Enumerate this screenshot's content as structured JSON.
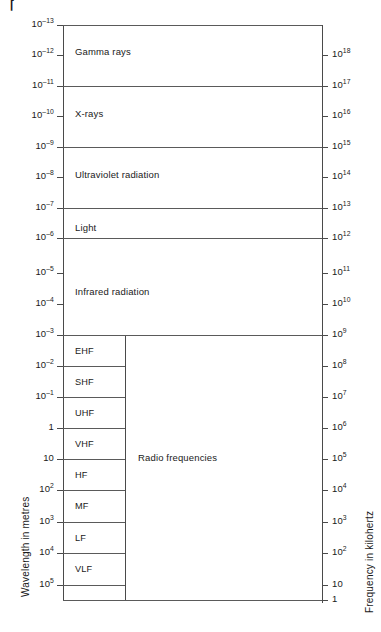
{
  "figure": {
    "type": "diagram"
  },
  "left_axis": {
    "title": "Wavelength in metres",
    "unit": "metres",
    "ticks": [
      {
        "label": "10",
        "exp": "–13",
        "value": -13,
        "y": 25
      },
      {
        "label": "10",
        "exp": "–12",
        "value": -12,
        "y": 55
      },
      {
        "label": "10",
        "exp": "–11",
        "value": -11,
        "y": 86
      },
      {
        "label": "10",
        "exp": "–10",
        "value": -10,
        "y": 116
      },
      {
        "label": "10",
        "exp": "–9",
        "value": -9,
        "y": 147
      },
      {
        "label": "10",
        "exp": "–8",
        "value": -8,
        "y": 177
      },
      {
        "label": "10",
        "exp": "–7",
        "value": -7,
        "y": 208
      },
      {
        "label": "10",
        "exp": "–6",
        "value": -6,
        "y": 238
      },
      {
        "label": "10",
        "exp": "–5",
        "value": -5,
        "y": 273
      },
      {
        "label": "10",
        "exp": "–4",
        "value": -4,
        "y": 304
      },
      {
        "label": "10",
        "exp": "–3",
        "value": -3,
        "y": 335
      },
      {
        "label": "10",
        "exp": "–2",
        "value": -2,
        "y": 366
      },
      {
        "label": "10",
        "exp": "–1",
        "value": -1,
        "y": 397
      },
      {
        "label": "1",
        "exp": "",
        "value": 0,
        "y": 428
      },
      {
        "label": "10",
        "exp": "",
        "value": 1,
        "y": 459
      },
      {
        "label": "10",
        "exp": "2",
        "value": 2,
        "y": 490
      },
      {
        "label": "10",
        "exp": "3",
        "value": 3,
        "y": 522
      },
      {
        "label": "10",
        "exp": "4",
        "value": 4,
        "y": 553
      },
      {
        "label": "10",
        "exp": "5",
        "value": 5,
        "y": 585
      }
    ]
  },
  "right_axis": {
    "title": "Frequency in kilohertz",
    "unit": "kilohertz",
    "ticks": [
      {
        "label": "10",
        "exp": "18",
        "value": 18,
        "y": 55
      },
      {
        "label": "10",
        "exp": "17",
        "value": 17,
        "y": 86
      },
      {
        "label": "10",
        "exp": "16",
        "value": 16,
        "y": 116
      },
      {
        "label": "10",
        "exp": "15",
        "value": 15,
        "y": 147
      },
      {
        "label": "10",
        "exp": "14",
        "value": 14,
        "y": 177
      },
      {
        "label": "10",
        "exp": "13",
        "value": 13,
        "y": 208
      },
      {
        "label": "10",
        "exp": "12",
        "value": 12,
        "y": 238
      },
      {
        "label": "10",
        "exp": "11",
        "value": 11,
        "y": 273
      },
      {
        "label": "10",
        "exp": "10",
        "value": 10,
        "y": 304
      },
      {
        "label": "10",
        "exp": "9",
        "value": 9,
        "y": 335
      },
      {
        "label": "10",
        "exp": "8",
        "value": 8,
        "y": 366
      },
      {
        "label": "10",
        "exp": "7",
        "value": 7,
        "y": 397
      },
      {
        "label": "10",
        "exp": "6",
        "value": 6,
        "y": 428
      },
      {
        "label": "10",
        "exp": "5",
        "value": 5,
        "y": 459
      },
      {
        "label": "10",
        "exp": "4",
        "value": 4,
        "y": 490
      },
      {
        "label": "10",
        "exp": "3",
        "value": 3,
        "y": 522
      },
      {
        "label": "10",
        "exp": "2",
        "value": 2,
        "y": 553
      },
      {
        "label": "10",
        "exp": "",
        "value": 1,
        "y": 585
      },
      {
        "label": "1",
        "exp": "",
        "value": 0,
        "y": 600
      }
    ]
  },
  "bands": [
    {
      "name": "Gamma rays",
      "top": 25,
      "bottom": 86,
      "label_y": 52
    },
    {
      "name": "X-rays",
      "top": 86,
      "bottom": 147,
      "label_y": 114
    },
    {
      "name": "Ultraviolet radiation",
      "top": 147,
      "bottom": 208,
      "label_y": 175
    },
    {
      "name": "Light",
      "top": 208,
      "bottom": 238,
      "label_y": 228
    },
    {
      "name": "Infrared radiation",
      "top": 238,
      "bottom": 335,
      "label_y": 292
    },
    {
      "name": "Radio frequencies",
      "top": 335,
      "bottom": 600,
      "label_y": 458
    }
  ],
  "radio_subbands": [
    {
      "name": "EHF",
      "top": 335,
      "bottom": 366,
      "label_y": 352
    },
    {
      "name": "SHF",
      "top": 366,
      "bottom": 397,
      "label_y": 383
    },
    {
      "name": "UHF",
      "top": 397,
      "bottom": 428,
      "label_y": 414
    },
    {
      "name": "VHF",
      "top": 428,
      "bottom": 459,
      "label_y": 445
    },
    {
      "name": "HF",
      "top": 459,
      "bottom": 490,
      "label_y": 476
    },
    {
      "name": "MF",
      "top": 490,
      "bottom": 522,
      "label_y": 507
    },
    {
      "name": "LF",
      "top": 522,
      "bottom": 553,
      "label_y": 539
    },
    {
      "name": "VLF",
      "top": 553,
      "bottom": 585,
      "label_y": 570
    }
  ],
  "colors": {
    "line": "#5a5a5a",
    "axis": "#4a4a4a",
    "text": "#1a1a1a",
    "background": "#ffffff"
  },
  "chart_data": {
    "type": "diagram",
    "xlabel": "",
    "ylabel": "Wavelength in metres",
    "y2label": "Frequency in kilohertz",
    "grid": false,
    "legend": "none",
    "ylim": [
      -13,
      5
    ],
    "y2lim": [
      18,
      0
    ],
    "categories": [
      "Gamma rays",
      "X-rays",
      "Ultraviolet radiation",
      "Light",
      "Infrared radiation",
      "Radio frequencies"
    ],
    "series": [
      {
        "name": "Wavelength ranges (log10 metres)",
        "bands": [
          {
            "name": "Gamma rays",
            "from": -13,
            "to": -11
          },
          {
            "name": "X-rays",
            "from": -11,
            "to": -9
          },
          {
            "name": "Ultraviolet radiation",
            "from": -9,
            "to": -7
          },
          {
            "name": "Light",
            "from": -7,
            "to": -6
          },
          {
            "name": "Infrared radiation",
            "from": -6,
            "to": -3
          },
          {
            "name": "Radio frequencies",
            "from": -3,
            "to": 5
          }
        ]
      },
      {
        "name": "Radio sub-bands (log10 metres)",
        "bands": [
          {
            "name": "EHF",
            "from": -3,
            "to": -2
          },
          {
            "name": "SHF",
            "from": -2,
            "to": -1
          },
          {
            "name": "UHF",
            "from": -1,
            "to": 0
          },
          {
            "name": "VHF",
            "from": 0,
            "to": 1
          },
          {
            "name": "HF",
            "from": 1,
            "to": 2
          },
          {
            "name": "MF",
            "from": 2,
            "to": 3
          },
          {
            "name": "LF",
            "from": 3,
            "to": 4
          },
          {
            "name": "VLF",
            "from": 4,
            "to": 5
          }
        ]
      },
      {
        "name": "Frequency ranges (log10 kilohertz)",
        "bands": [
          {
            "name": "Gamma rays",
            "from": 18,
            "to": 17
          },
          {
            "name": "X-rays",
            "from": 17,
            "to": 15
          },
          {
            "name": "Ultraviolet radiation",
            "from": 15,
            "to": 13
          },
          {
            "name": "Light",
            "from": 13,
            "to": 12
          },
          {
            "name": "Infrared radiation",
            "from": 12,
            "to": 9
          },
          {
            "name": "Radio frequencies",
            "from": 9,
            "to": 0
          }
        ]
      }
    ]
  }
}
